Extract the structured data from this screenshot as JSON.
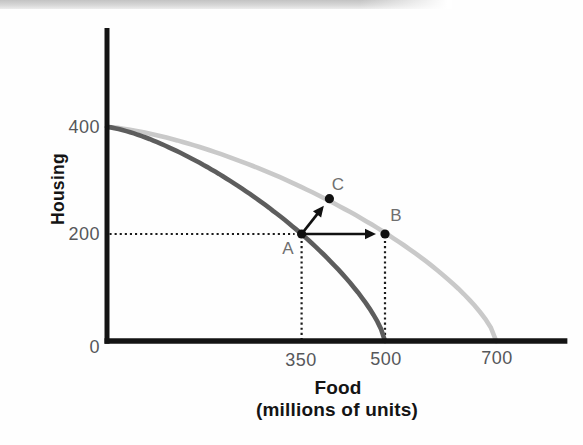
{
  "chart_data": {
    "type": "line",
    "title": "",
    "xlabel": "Food",
    "xlabel_sub": "(millions of units)",
    "ylabel": "Housing",
    "x_ticks": [
      "350",
      "500",
      "700"
    ],
    "x_tick_values": [
      350,
      500,
      700
    ],
    "y_ticks": [
      "400",
      "200",
      "0"
    ],
    "y_tick_values": [
      400,
      200,
      0
    ],
    "xlim": [
      0,
      828
    ],
    "ylim": [
      0,
      585
    ],
    "grid": false,
    "legend": "none",
    "series": [
      {
        "name": "initial-ppf",
        "color": "#5d5d5d",
        "x_intercept": 500,
        "y_intercept": 400,
        "curve_exponent": 1.37,
        "passes_through": [
          [
            350,
            200
          ]
        ]
      },
      {
        "name": "expanded-ppf",
        "color": "#c9c9c9",
        "x_intercept": 700,
        "y_intercept": 400,
        "curve_exponent": 1.42,
        "passes_through": [
          [
            500,
            200
          ],
          [
            400,
            266
          ]
        ]
      }
    ],
    "points": [
      {
        "label": "A",
        "x": 350,
        "y": 200,
        "on": "initial-ppf"
      },
      {
        "label": "B",
        "x": 500,
        "y": 200,
        "on": "expanded-ppf"
      },
      {
        "label": "C",
        "x": 400,
        "y": 266,
        "on": "expanded-ppf"
      }
    ],
    "arrows": [
      {
        "name": "a-to-b",
        "from": [
          350,
          200
        ],
        "to": [
          500,
          200
        ]
      },
      {
        "name": "a-to-c",
        "from": [
          350,
          200
        ],
        "to": [
          400,
          266
        ]
      }
    ],
    "dotted_guides": [
      {
        "type": "horizontal",
        "y": 200,
        "x_from": 0,
        "x_to": 350
      },
      {
        "type": "vertical",
        "x": 350,
        "y_from": 0,
        "y_to": 200
      },
      {
        "type": "vertical",
        "x": 500,
        "y_from": 0,
        "y_to": 200
      }
    ],
    "colors": {
      "axis": "#141414",
      "tick_label": "#56575a",
      "point_label": "#6f6f6f",
      "point_dot": "#111111",
      "arrow": "#111111",
      "guide": "#1a1a1a"
    }
  }
}
